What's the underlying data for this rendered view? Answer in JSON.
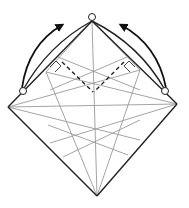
{
  "diagram": {
    "type": "origami-fold-step",
    "colors": {
      "background": "#ffffff",
      "crease": "#9a9a9a",
      "edge": "#222222",
      "arrow": "#111111"
    },
    "vertices": {
      "top": [
        92,
        21
      ],
      "left": [
        8,
        107
      ],
      "bottom": [
        97,
        196
      ],
      "right": [
        177,
        104
      ]
    },
    "circles": [
      [
        92,
        17
      ],
      [
        23,
        91
      ],
      [
        165,
        91
      ]
    ],
    "arrows": [
      {
        "name": "left-fold-arrow",
        "from": [
          23,
          88
        ],
        "to": [
          62,
          25
        ]
      },
      {
        "name": "right-fold-arrow",
        "from": [
          165,
          88
        ],
        "to": [
          121,
          25
        ]
      }
    ],
    "dashed_folds": [
      {
        "from": [
          62,
          62
        ],
        "to": [
          93,
          92
        ]
      },
      {
        "from": [
          124,
          62
        ],
        "to": [
          94,
          92
        ]
      }
    ]
  }
}
